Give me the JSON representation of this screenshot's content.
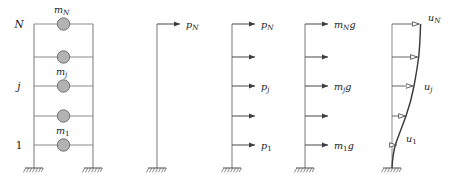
{
  "figure": {
    "type": "structural-engineering-diagram",
    "panels": [
      {
        "id": "panel-frame-masses",
        "name": "multistory-frame-with-lumped-masses",
        "kind": "frame",
        "level_labels": [
          {
            "text": "N",
            "level": 5
          },
          {
            "text": "j",
            "level": 3
          },
          {
            "text": "1",
            "level": 1
          }
        ],
        "mass_labels": [
          {
            "base": "m",
            "sub": "N",
            "level": 5
          },
          {
            "base": "m",
            "sub": "j",
            "level": 3
          },
          {
            "base": "m",
            "sub": "1",
            "level": 1
          }
        ],
        "floors": 5,
        "masses": 5,
        "supports": 2
      },
      {
        "id": "panel-single-force",
        "name": "cantilever-single-top-force",
        "kind": "cantilever",
        "arrows": [
          {
            "level": 5,
            "label_base": "p",
            "label_sub": "N"
          }
        ],
        "supports": 1
      },
      {
        "id": "panel-force-distribution",
        "name": "cantilever-lateral-force-distribution",
        "kind": "cantilever",
        "arrows": [
          {
            "level": 5,
            "label_base": "p",
            "label_sub": "N"
          },
          {
            "level": 4,
            "label_base": "",
            "label_sub": ""
          },
          {
            "level": 3,
            "label_base": "p",
            "label_sub": "j"
          },
          {
            "level": 2,
            "label_base": "",
            "label_sub": ""
          },
          {
            "level": 1,
            "label_base": "p",
            "label_sub": "1"
          }
        ],
        "supports": 1
      },
      {
        "id": "panel-gravity-forces",
        "name": "cantilever-gravity-proportional-forces",
        "kind": "cantilever",
        "arrows": [
          {
            "level": 5,
            "label_base": "m",
            "label_sub": "N",
            "label_tail": "g"
          },
          {
            "level": 4,
            "label_base": "",
            "label_sub": "",
            "label_tail": ""
          },
          {
            "level": 3,
            "label_base": "m",
            "label_sub": "j",
            "label_tail": "g"
          },
          {
            "level": 2,
            "label_base": "",
            "label_sub": "",
            "label_tail": ""
          },
          {
            "level": 1,
            "label_base": "m",
            "label_sub": "1",
            "label_tail": "g"
          }
        ],
        "supports": 1
      },
      {
        "id": "panel-deflected-shape",
        "name": "cantilever-deflected-shape",
        "kind": "deflected",
        "displacements": [
          {
            "level": 5,
            "label_base": "u",
            "label_sub": "N"
          },
          {
            "level": 4,
            "label_base": "",
            "label_sub": ""
          },
          {
            "level": 3,
            "label_base": "u",
            "label_sub": "j"
          },
          {
            "level": 2,
            "label_base": "",
            "label_sub": ""
          },
          {
            "level": 1,
            "label_base": "u",
            "label_sub": "1"
          }
        ],
        "supports": 1
      }
    ],
    "colors": {
      "line": "#808080",
      "dark_line": "#404040",
      "mass_fill": "#b3b3b3",
      "mass_stroke": "#737373",
      "text": "#1a1a1a",
      "background": "#ffffff"
    },
    "geometry": {
      "floor_y": [
        24,
        57,
        86,
        116,
        145
      ],
      "base_y": 168,
      "frame_left_x": 34,
      "frame_right_x": 93,
      "cantilever_x": [
        157,
        232,
        305,
        392
      ]
    }
  }
}
